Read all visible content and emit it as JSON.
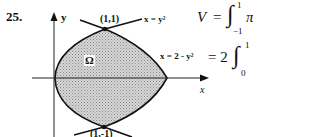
{
  "problem_number": "25.",
  "figure": {
    "y_axis_label": "y",
    "x_axis_label": "x",
    "region_label": "Ω",
    "top_point": "(1,1)",
    "bottom_point": "(1,-1)",
    "curve1_label": "x = y²",
    "curve2_label": "x = 2 - y²"
  },
  "equations": {
    "line1_lhs": "V",
    "line1_eq": "=",
    "line1_int": "∫",
    "line1_upper": "1",
    "line1_lower": "−1",
    "line1_tail": "π",
    "line2_eq": "= 2",
    "line2_int": "∫",
    "line2_upper": "1",
    "line2_lower": "0"
  }
}
